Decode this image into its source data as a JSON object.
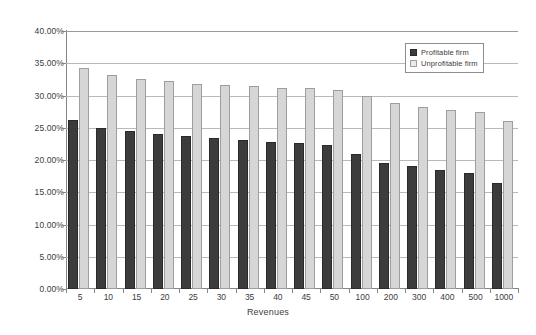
{
  "chart_data": {
    "type": "bar",
    "title": "",
    "subtitle": "",
    "xlabel": "Revenues",
    "ylabel": "",
    "categories": [
      "5",
      "10",
      "15",
      "20",
      "25",
      "30",
      "35",
      "40",
      "45",
      "50",
      "100",
      "200",
      "300",
      "400",
      "500",
      "1000"
    ],
    "series": [
      {
        "name": "Profitable firm",
        "color": "#3c3c3c",
        "values": [
          26.2,
          25.0,
          24.5,
          24.1,
          23.7,
          23.4,
          23.1,
          22.8,
          22.6,
          22.3,
          21.0,
          19.6,
          19.0,
          18.4,
          18.0,
          16.5
        ]
      },
      {
        "name": "Unprofitable firm",
        "color": "#d6d6d6",
        "values": [
          34.2,
          33.2,
          32.6,
          32.2,
          31.8,
          31.6,
          31.4,
          31.2,
          31.1,
          30.9,
          29.9,
          28.8,
          28.2,
          27.8,
          27.4,
          26.1
        ]
      }
    ],
    "ylim": [
      0,
      40
    ],
    "ytick_values": [
      0,
      5,
      10,
      15,
      20,
      25,
      30,
      35,
      40
    ],
    "ytick_labels": [
      "0.00%",
      "5.00%",
      "10.00%",
      "15.00%",
      "20.00%",
      "25.00%",
      "30.00%",
      "35.00%",
      "40.00%"
    ],
    "grid": true,
    "grid_axis": "y",
    "legend_position": "top-right",
    "value_unit": "percent"
  },
  "legend": {
    "entries": [
      {
        "label": "Profitable firm",
        "swatch": "dark-square-swatch"
      },
      {
        "label": "Unprofitable firm",
        "swatch": "light-square-swatch"
      }
    ]
  },
  "axes": {
    "x_title": "Revenues"
  }
}
